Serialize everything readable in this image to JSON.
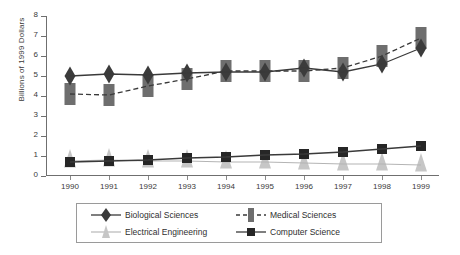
{
  "chart_data": {
    "type": "line",
    "title": "",
    "xlabel": "",
    "ylabel": "Billions of 1999 Dollars",
    "categories": [
      "1990",
      "1991",
      "1992",
      "1993",
      "1994",
      "1995",
      "1996",
      "1997",
      "1998",
      "1999"
    ],
    "x": [
      1990,
      1991,
      1992,
      1993,
      1994,
      1995,
      1996,
      1997,
      1998,
      1999
    ],
    "ylim": [
      0,
      8
    ],
    "yticks": [
      0,
      1,
      2,
      3,
      4,
      5,
      6,
      7,
      8
    ],
    "ytick_labels": [
      "0",
      "1",
      "2",
      "3",
      "4",
      "5",
      "6",
      "7",
      "8"
    ],
    "grid": false,
    "legend_position": "bottom",
    "series": [
      {
        "name": "Biological Sciences",
        "marker": "diamond",
        "color": "#3b3b3b",
        "linestyle": "solid",
        "values": [
          5.0,
          5.1,
          5.05,
          5.15,
          5.2,
          5.2,
          5.4,
          5.2,
          5.6,
          6.4
        ]
      },
      {
        "name": "Medical Sciences",
        "marker": "bar",
        "color": "#6e6e6e",
        "linestyle": "dashed",
        "values": [
          4.1,
          4.05,
          4.5,
          4.85,
          5.25,
          5.25,
          5.25,
          5.4,
          6.0,
          6.9
        ]
      },
      {
        "name": "Electrical Engineering",
        "marker": "triangle",
        "color": "#c6c6c6",
        "linestyle": "solid",
        "values": [
          0.75,
          0.8,
          0.75,
          0.75,
          0.7,
          0.7,
          0.65,
          0.6,
          0.6,
          0.55
        ]
      },
      {
        "name": "Computer Science",
        "marker": "square",
        "color": "#262626",
        "linestyle": "solid",
        "values": [
          0.7,
          0.75,
          0.8,
          0.9,
          0.95,
          1.05,
          1.1,
          1.2,
          1.35,
          1.5
        ]
      }
    ]
  },
  "legend": {
    "items": [
      {
        "label": "Biological Sciences",
        "marker": "diamond-marker",
        "color": "#3b3b3b",
        "linestyle": "solid"
      },
      {
        "label": "Medical Sciences",
        "marker": "bar-marker",
        "color": "#6e6e6e",
        "linestyle": "dashed"
      },
      {
        "label": "Electrical Engineering",
        "marker": "triangle-marker",
        "color": "#c6c6c6",
        "linestyle": "solid"
      },
      {
        "label": "Computer Science",
        "marker": "square-marker",
        "color": "#262626",
        "linestyle": "solid"
      }
    ]
  }
}
